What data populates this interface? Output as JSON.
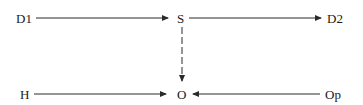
{
  "diagram": {
    "type": "flow",
    "colors": {
      "line": "#2a2a2a",
      "text": "#1a1a1a",
      "background": "#ffffff"
    },
    "nodes": [
      {
        "id": "D1",
        "label": "D1"
      },
      {
        "id": "S",
        "label": "S"
      },
      {
        "id": "D2",
        "label": "D2"
      },
      {
        "id": "H",
        "label": "H"
      },
      {
        "id": "O",
        "label": "O"
      },
      {
        "id": "Op",
        "label": "Op"
      }
    ],
    "edges": [
      {
        "from": "D1",
        "to": "S",
        "style": "solid"
      },
      {
        "from": "S",
        "to": "D2",
        "style": "solid"
      },
      {
        "from": "S",
        "to": "O",
        "style": "dashed"
      },
      {
        "from": "H",
        "to": "O",
        "style": "solid"
      },
      {
        "from": "Op",
        "to": "O",
        "style": "solid"
      }
    ]
  }
}
